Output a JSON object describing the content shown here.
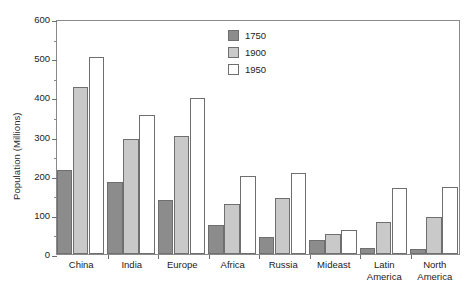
{
  "chart_data": {
    "type": "bar",
    "title": "",
    "xlabel": "",
    "ylabel": "Population (Millions)",
    "ylim": [
      0,
      600
    ],
    "y_ticks": [
      0,
      100,
      200,
      300,
      400,
      500,
      600
    ],
    "y_minor_ticks": [
      50,
      150,
      250,
      350,
      450,
      550
    ],
    "grid": false,
    "legend_position": "top-center",
    "categories": [
      "China",
      "India",
      "Europe",
      "Africa",
      "Russia",
      "Mideast",
      "Latin\nAmerica",
      "North\nAmerica"
    ],
    "series": [
      {
        "name": "1750",
        "color": "#8c8c8c",
        "values": [
          215,
          183,
          137,
          75,
          43,
          35,
          16,
          13
        ]
      },
      {
        "name": "1900",
        "color": "#c9c9c9",
        "values": [
          427,
          293,
          302,
          128,
          143,
          50,
          81,
          94
        ]
      },
      {
        "name": "1950",
        "color": "#ffffff",
        "values": [
          503,
          355,
          398,
          200,
          208,
          62,
          168,
          172
        ]
      }
    ]
  },
  "style": {
    "bar_border_color": "#6f6f6f",
    "axis_color": "#8a8a8a",
    "text_color": "#222222"
  }
}
